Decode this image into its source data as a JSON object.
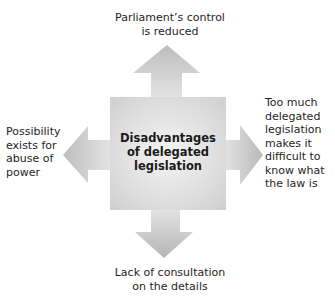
{
  "diagram": {
    "title": "Disadvantages of delegated legislation",
    "center_label": "Disadvantages of delegated legislation",
    "center_lines": [
      "Disadvantages",
      "of delegated",
      "legislation"
    ],
    "branches": [
      {
        "direction": "up",
        "lines": [
          "Parliament’s control",
          "is reduced"
        ]
      },
      {
        "direction": "right",
        "lines": [
          "Too much",
          "delegated",
          "legislation",
          "makes it",
          "difficult to",
          "know what",
          "the law is"
        ]
      },
      {
        "direction": "down",
        "lines": [
          "Lack of consultation",
          "on the details"
        ]
      },
      {
        "direction": "left",
        "lines": [
          "Possibility",
          "exists for",
          "abuse of",
          "power"
        ]
      }
    ],
    "colors": {
      "shape_light": "#f2f2f2",
      "shape_dark": "#b8b8b8",
      "text": "#1e1e1e"
    }
  }
}
